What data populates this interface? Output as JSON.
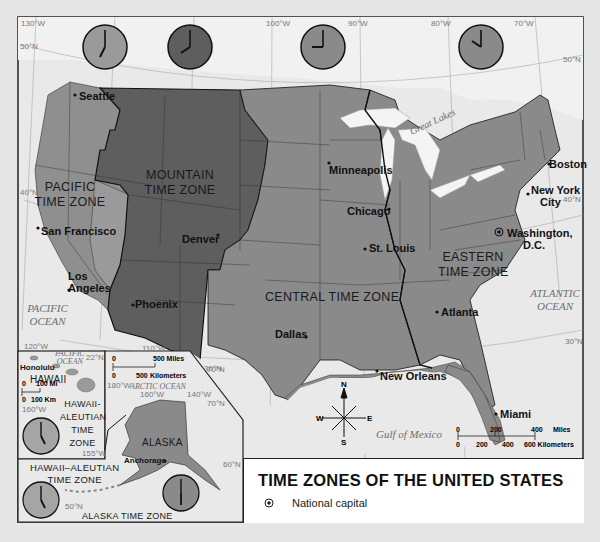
{
  "title": "TIME ZONES OF THE UNITED STATES",
  "legend": {
    "items": [
      {
        "symbol": "national-capital-icon",
        "label": "National capital"
      }
    ]
  },
  "time_zones": [
    {
      "id": "pacific",
      "label_line1": "PACIFIC",
      "label_line2": "TIME ZONE",
      "clock": "7:00",
      "color": "#8f8f8f"
    },
    {
      "id": "mountain",
      "label_line1": "MOUNTAIN",
      "label_line2": "TIME ZONE",
      "clock": "8:00",
      "color": "#5e5e5e"
    },
    {
      "id": "central",
      "label": "CENTRAL TIME ZONE",
      "clock": "9:00",
      "color": "#8a8a8a"
    },
    {
      "id": "eastern",
      "label_line1": "EASTERN",
      "label_line2": "TIME ZONE",
      "clock": "10:00",
      "color": "#8a8a8a"
    },
    {
      "id": "alaska",
      "label": "ALASKA TIME ZONE",
      "clock": "6:00",
      "color": "#8a8a8a"
    },
    {
      "id": "hawaii-aleutian",
      "label_line1": "HAWAII-",
      "label_line2": "ALEUTIAN",
      "label_line3": "TIME",
      "label_line4": "ZONE",
      "alt_label_line1": "HAWAII–ALEUTIAN",
      "alt_label_line2": "TIME ZONE",
      "clock": "5:00",
      "color": "#9a9a9a"
    }
  ],
  "cities": {
    "seattle": "Seattle",
    "san_francisco": "San Francisco",
    "los_angeles_1": "Los",
    "los_angeles_2": "Angeles",
    "phoenix": "Phoenix",
    "denver": "Denver",
    "dallas": "Dallas",
    "minneapolis": "Minneapolis",
    "chicago": "Chicago",
    "st_louis": "St. Louis",
    "new_orleans": "New Orleans",
    "atlanta": "Atlanta",
    "miami": "Miami",
    "washington_1": "Washington,",
    "washington_2": "D.C.",
    "new_york_1": "New York",
    "new_york_2": "City",
    "boston": "Boston",
    "honolulu": "Honolulu",
    "anchorage": "Anchorage"
  },
  "regions": {
    "hawaii": "HAWAII",
    "alaska": "ALASKA",
    "great_lakes_1": "Great",
    "great_lakes_2": "Lakes"
  },
  "water": {
    "pacific_1": "PACIFIC",
    "pacific_2": "OCEAN",
    "atlantic_1": "ATLANTIC",
    "atlantic_2": "OCEAN",
    "gulf": "Gulf of Mexico",
    "inset_pacific_1": "PACIFIC",
    "inset_pacific_2": "OCEAN",
    "arctic": "ARCTIC OCEAN"
  },
  "graticule": {
    "lon_130": "130°W",
    "lon_100": "100°W",
    "lon_90": "90°W",
    "lon_80": "80°W",
    "lon_70": "70°W",
    "lon_120": "120°W",
    "lon_110": "110°W",
    "lat_50": "50°N",
    "lat_40w": "40°N",
    "lat_40e": "40°N",
    "lat_30w": "30°N",
    "lat_30e": "30°N",
    "lat_50e": "50°N",
    "inset_lat_22": "22°N",
    "inset_lon_160": "160°W",
    "inset_lon_155": "155°W",
    "ak_lon_180": "180°W",
    "ak_lon_160": "160°W",
    "ak_lon_140": "140°W",
    "ak_lat_70": "70°N",
    "ak_lat_60": "60°N",
    "ak_lat_50": "50°N",
    "ak_lat_70b": "70°N"
  },
  "scale_main": {
    "miles": [
      "0",
      "200",
      "400",
      "Miles"
    ],
    "km": [
      "0",
      "200",
      "400",
      "600 Kilometers"
    ]
  },
  "scale_alaska": {
    "miles": [
      "0",
      "500 Miles"
    ],
    "km": [
      "0",
      "500",
      "Kilometers"
    ]
  },
  "scale_hawaii": {
    "miles": [
      "0",
      "100 Mi"
    ],
    "km": [
      "0",
      "100 Km"
    ]
  },
  "compass": {
    "n": "N",
    "s": "S",
    "e": "E",
    "w": "W"
  }
}
